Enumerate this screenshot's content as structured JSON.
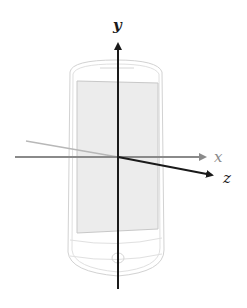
{
  "diagram": {
    "axes": {
      "x": {
        "label": "x",
        "color": "#8a8a8a"
      },
      "y": {
        "label": "y",
        "color": "#1a1a1a"
      },
      "z": {
        "label": "z",
        "color": "#1a1a1a"
      },
      "neg_z": {
        "color": "#b8b8b8"
      }
    },
    "device": {
      "body_stroke": "#cfcfcf",
      "screen_fill": "#ececec",
      "screen_stroke": "#c8c8c8"
    }
  }
}
